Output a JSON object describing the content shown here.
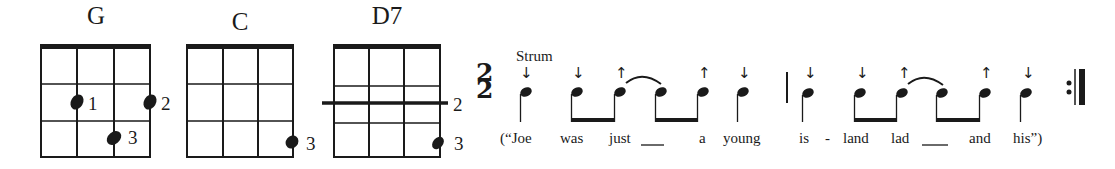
{
  "chords": [
    {
      "name": "G",
      "fingers": [
        {
          "label": "1"
        },
        {
          "label": "2"
        },
        {
          "label": "3"
        }
      ]
    },
    {
      "name": "C",
      "fingers": [
        {
          "label": "3"
        }
      ]
    },
    {
      "name": "D7",
      "fingers": [
        {
          "label": "2"
        },
        {
          "label": "3"
        }
      ]
    }
  ],
  "time_signature": {
    "top": "2",
    "bottom": "2"
  },
  "strum_label": "Strum",
  "strum_directions": {
    "measure1": [
      "down",
      "down",
      "up",
      "",
      "up",
      "down"
    ],
    "measure2": [
      "down",
      "down",
      "up",
      "",
      "up",
      "down"
    ],
    "down_glyph": "↓",
    "up_glyph": "↑"
  },
  "lyrics": {
    "measure1": [
      "(“Joe",
      "was",
      "just",
      "___",
      "a",
      "young"
    ],
    "measure2": [
      "is",
      "-",
      "land",
      "lad",
      "___",
      "and",
      "his”)"
    ]
  },
  "colors": {
    "ink": "#1a1a1a",
    "background": "#ffffff"
  },
  "end_marker": "repeat-end-barline"
}
